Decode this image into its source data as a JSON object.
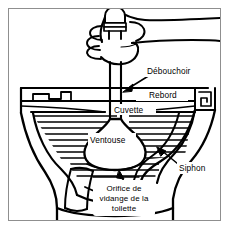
{
  "figure": {
    "language": "fr",
    "frame_color": "#8f8f8f",
    "ink_color": "#000000",
    "background_color": "#ffffff"
  },
  "labels": {
    "debouchoir": "Débouchoir",
    "rebord": "Rebord",
    "cuvette": "Cuvette",
    "ventouse": "Ventouse",
    "siphon": "Siphon",
    "orifice_line1": "Orifice de",
    "orifice_line2": "vidange de la",
    "orifice_line3": "toilette"
  },
  "parts": [
    {
      "name": "debouchoir",
      "label": "Débouchoir",
      "description": "Manche du débouchoir tenu à la main"
    },
    {
      "name": "rebord",
      "label": "Rebord",
      "description": "Rebord de la cuvette"
    },
    {
      "name": "cuvette",
      "label": "Cuvette",
      "description": "Cuvette de la toilette"
    },
    {
      "name": "ventouse",
      "label": "Ventouse",
      "description": "Ventouse en caoutchouc du débouchoir"
    },
    {
      "name": "siphon",
      "label": "Siphon",
      "description": "Siphon de la toilette"
    },
    {
      "name": "orifice-de-vidange",
      "label": "Orifice de vidange de la toilette",
      "description": "Orifice de vidange au fond de la cuvette"
    }
  ]
}
